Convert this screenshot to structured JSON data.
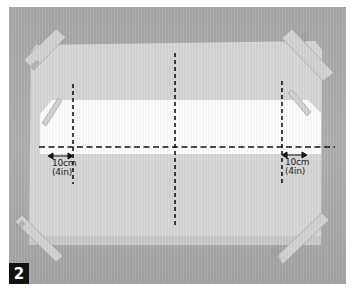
{
  "figure": {
    "step_number": "2",
    "colors": {
      "background_surface": "#acacac",
      "paper": "#d9d9d9",
      "strip": "#ffffff",
      "tape": "#cfcfcf",
      "guide_lines": "#111111",
      "badge_bg": "#111111",
      "badge_text": "#ffffff"
    },
    "annotations": {
      "left_measure": {
        "metric": "10cm",
        "imperial": "(4in)"
      },
      "right_measure": {
        "metric": "10cm",
        "imperial": "(4in)"
      }
    },
    "elements": {
      "paper_sheet": "taped paper sheet",
      "white_strip": "white paper strip",
      "tape_pieces": [
        "top-left tape",
        "top-right tape",
        "bottom-left tape",
        "bottom-right tape",
        "strip-left tape",
        "strip-right tape"
      ],
      "guide_lines": [
        "horizontal dashed fold line",
        "left vertical dashed line",
        "center vertical dashed line",
        "right vertical dashed line"
      ]
    }
  }
}
